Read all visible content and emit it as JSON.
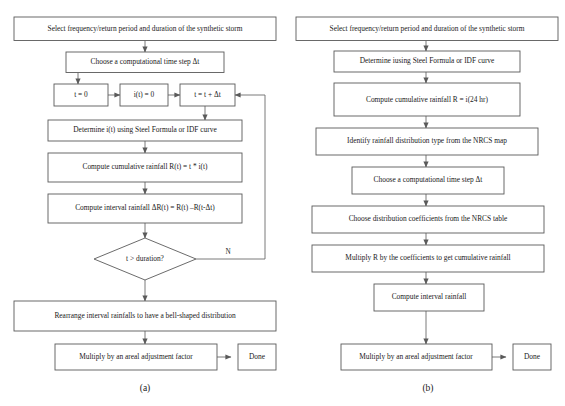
{
  "figure": {
    "background_color": "#ffffff",
    "line_color": "#5a5a5a",
    "text_color": "#1a1a1a"
  },
  "panel_a": {
    "caption": "(a)",
    "nodes": {
      "start": "Select frequency/return period and duration of the synthetic storm",
      "timestep": "Choose a computational time step Δt",
      "init_t": "t = 0",
      "init_i": "i(t) = 0",
      "increment_t": "t = t + Δt",
      "determine_i": "Determine i(t) using Steel Formula or IDF curve",
      "cumulative": "Compute cumulative rainfall R(t) = t * i(t)",
      "interval": "Compute interval rainfall ΔR(t) = R(t) –R(t-Δt)",
      "decision": "t > duration?",
      "rearrange": "Rearrange interval rainfalls to have a bell-shaped distribution",
      "areal": "Multiply by an areal adjustment factor",
      "done": "Done"
    },
    "edge_labels": {
      "no_branch": "N"
    }
  },
  "panel_b": {
    "caption": "(b)",
    "nodes": {
      "start": "Select frequency/return period and duration of the synthetic storm",
      "determine_i": "Determine iusing Steel Formula or IDF curve",
      "cumulative": "Compute cumulative rainfall R = i(24 hr)",
      "identify": "Identify rainfall distribution type from the NRCS map",
      "timestep": "Choose a computational time step Δt",
      "coefficients": "Choose distribution coefficients from the NRCS table",
      "multiply_r": "Multiply R by the coefficients to get cumulative rainfall",
      "interval": "Compute interval rainfall",
      "areal": "Multiply by an areal adjustment factor",
      "done": "Done"
    }
  }
}
